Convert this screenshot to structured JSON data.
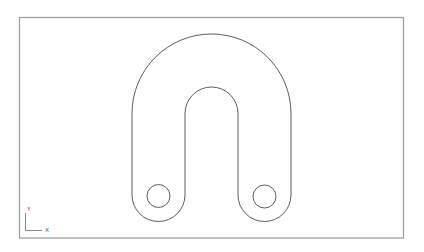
{
  "viewport": {
    "background": "#ffffff",
    "frame_color": "#9a9a9a",
    "stroke_color": "#4a4a4a"
  },
  "drawing": {
    "part": "U-shaped bracket",
    "outer_arc": {
      "cx": 211.5,
      "cy": 113.5,
      "r": 79.5
    },
    "inner_arc": {
      "cx": 211.5,
      "cy": 113.5,
      "r": 26.5
    },
    "left_foot": {
      "cx": 159,
      "cy": 195,
      "r": 27
    },
    "right_foot": {
      "cx": 264.5,
      "cy": 195,
      "r": 26.5
    },
    "left_hole": {
      "cx": 159,
      "cy": 196,
      "r": 11.5
    },
    "right_hole": {
      "cx": 265,
      "cy": 196.5,
      "r": 11.5
    }
  },
  "ucs_icon": {
    "y_label": "Y",
    "x_label": "X"
  }
}
